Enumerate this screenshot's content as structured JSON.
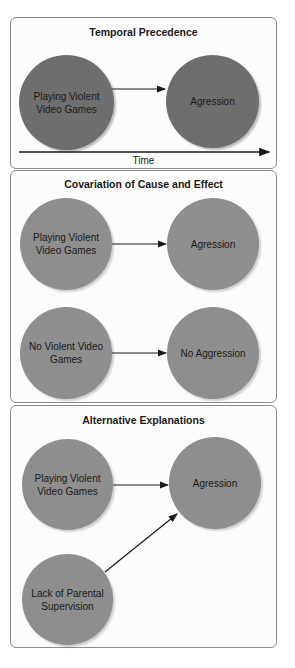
{
  "colors": {
    "panel_border": "#8c8c8c",
    "panel_bg": "#fcfcfc",
    "circle_dark": "#6e6e6e",
    "circle_light": "#8e8e8e",
    "arrow": "#1a1a1a",
    "text": "#1a1a1a"
  },
  "panels": [
    {
      "title": "Temporal Precedence",
      "nodes": {
        "cause": "Playing Violent Video Games",
        "effect": "Agression"
      },
      "axis_label": "Time"
    },
    {
      "title": "Covariation of Cause and Effect",
      "rows": [
        {
          "cause": "Playing Violent Video Games",
          "effect": "Agression"
        },
        {
          "cause": "No Violent Video Games",
          "effect": "No Aggression"
        }
      ]
    },
    {
      "title": "Alternative Explanations",
      "nodes": {
        "cause": "Playing Violent Video Games",
        "effect": "Agression",
        "alternative": "Lack of Parental Supervision"
      }
    }
  ],
  "edges": [
    {
      "panel": 0,
      "from": "Playing Violent Video Games",
      "to": "Agression"
    },
    {
      "panel": 1,
      "from": "Playing Violent Video Games",
      "to": "Agression"
    },
    {
      "panel": 1,
      "from": "No Violent Video Games",
      "to": "No Aggression"
    },
    {
      "panel": 2,
      "from": "Playing Violent Video Games",
      "to": "Agression"
    },
    {
      "panel": 2,
      "from": "Lack of Parental Supervision",
      "to": "Agression"
    }
  ]
}
